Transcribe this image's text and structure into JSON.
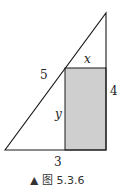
{
  "figure": {
    "caption": "▲ 图 5.3.6",
    "labels": {
      "hypotenuse": "5",
      "height": "4",
      "base": "3",
      "rect_top": "x",
      "rect_side": "y"
    },
    "colors": {
      "line": "#1a1a1a",
      "rect_fill": "#cfcfcf"
    }
  }
}
